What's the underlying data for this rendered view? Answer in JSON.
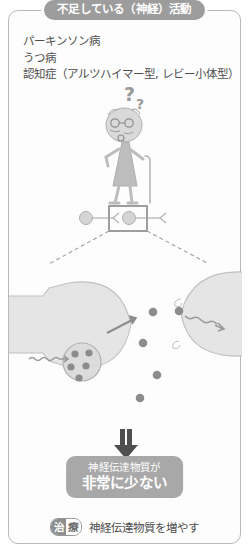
{
  "header": {
    "badge_label": "不足している（神経）活動",
    "badge_bg": "#9d9d9d",
    "badge_text_color": "#ffffff"
  },
  "diseases": {
    "items": [
      "パーキンソン病",
      "うつ病",
      "認知症（アルツハイマー型, レビー小体型）"
    ]
  },
  "illustration": {
    "person": {
      "name": "elderly-person-with-cane",
      "thought_marks": "？？"
    },
    "neuron_chain": {
      "name": "neuron-chain-overview",
      "highlight_box": "synapse-zoom-box"
    },
    "synapse": {
      "presynaptic_label": "presynaptic-terminal",
      "postsynaptic_label": "postsynaptic-membrane",
      "vesicle_dot_count": 5,
      "cleft_dot_count": 4,
      "receptor_dot_count": 1,
      "signal_arrow": "incoming-impulse-arrow",
      "release_arrow": "vesicle-release-arrow",
      "output_arrow": "postsynaptic-signal-arrow"
    },
    "down_arrow": "double-down-arrow",
    "colors": {
      "cell_fill": "#e3e3e3",
      "cell_stroke": "#b5b5b5",
      "dot": "#8c8c8c",
      "line": "#a8a8a8"
    }
  },
  "conclusion": {
    "line1": "神経伝達物質が",
    "line2": "非常に少ない",
    "bg": "#a8a8a8"
  },
  "treatment": {
    "badge_char1": "治",
    "badge_char2": "療",
    "text": "神経伝達物質を増やす"
  }
}
